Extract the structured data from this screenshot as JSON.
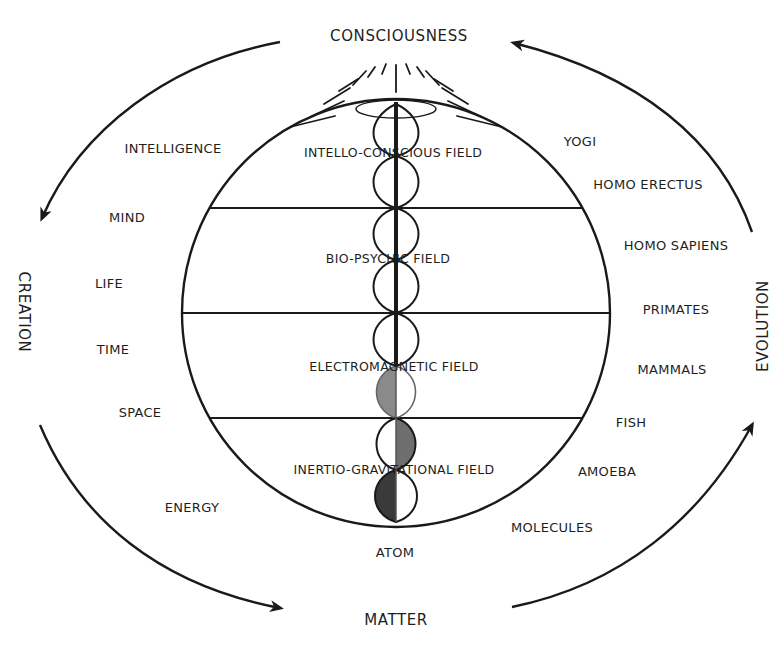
{
  "cycle": {
    "top": "CONSCIOUSNESS",
    "bottom": "MATTER",
    "left": "CREATION",
    "right": "EVOLUTION"
  },
  "creation_stages": [
    "INTELLIGENCE",
    "MIND",
    "LIFE",
    "TIME",
    "SPACE",
    "ENERGY"
  ],
  "evolution_stages": [
    "YOGI",
    "HOMO ERECTUS",
    "HOMO SAPIENS",
    "PRIMATES",
    "MAMMALS",
    "FISH",
    "AMOEBA",
    "MOLECULES"
  ],
  "fields": [
    "INTELLO-CONSCIOUS FIELD",
    "BIO-PSYCHIC FIELD",
    "ELECTROMAGNETIC FIELD",
    "INERTIO-GRAVITATIONAL FIELD"
  ],
  "base_label": "ATOM",
  "colors": {
    "line": "#1a1a1a",
    "dark_fill": "#3a3a3a",
    "medium_fill": "#6e6e6e",
    "light_fill": "#8a8a8a"
  }
}
